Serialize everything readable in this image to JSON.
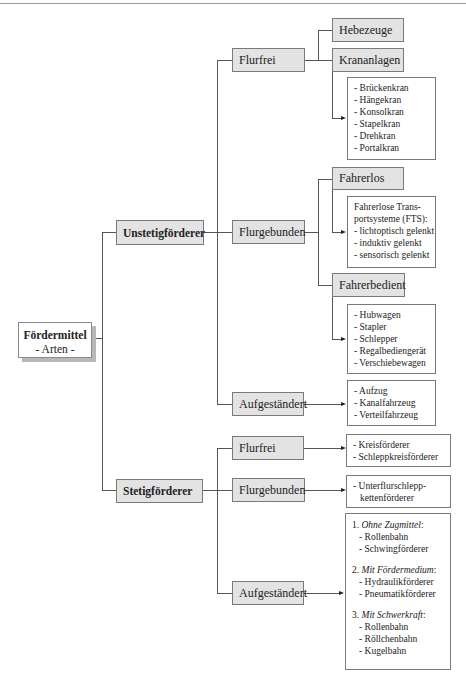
{
  "root": {
    "title": "Fördermittel",
    "subtitle": "- Arten -"
  },
  "unstetig": {
    "label": "Unstetigförderer",
    "flurfrei": {
      "label": "Flurfrei",
      "hebezeuge": "Hebezeuge",
      "krananlagen": "Krananlagen",
      "kran_list": [
        "- Brückenkran",
        "- Hängekran",
        "- Konsolkran",
        "- Stapelkran",
        "- Drehkran",
        "- Portalkran"
      ]
    },
    "flurgebunden": {
      "label": "Flurgebunden",
      "fahrerlos": "Fahrerlos",
      "fts_list": [
        "Fahrerlose Trans-",
        "portsysteme (FTS):",
        "- lichtoptisch gelenkt",
        "- induktiv gelenkt",
        "- sensorisch gelenkt"
      ],
      "fahrerbedient": "Fahrerbedient",
      "fahrerbedient_list": [
        "- Hubwagen",
        "- Stapler",
        "- Schlepper",
        "- Regalbediengerät",
        "- Verschiebewagen"
      ]
    },
    "aufgestaendert": {
      "label": "Aufgeständert",
      "list": [
        "- Aufzug",
        "- Kanalfahrzeug",
        "- Verteilfahrzeug"
      ]
    }
  },
  "stetig": {
    "label": "Stetigförderer",
    "flurfrei": {
      "label": "Flurfrei",
      "list": [
        "- Kreisförderer",
        "- Schleppkreisförderer"
      ]
    },
    "flurgebunden": {
      "label": "Flurgebunden",
      "list": [
        "- Unterflurschlepp-",
        "kettenförderer"
      ]
    },
    "aufgestaendert": {
      "label": "Aufgeständert",
      "groups": [
        {
          "num": "1.",
          "title": "Ohne Zugmittel",
          "items": [
            "- Rollenbahn",
            "- Schwingförderer"
          ]
        },
        {
          "num": "2.",
          "title": "Mit Fördermedium",
          "items": [
            "- Hydraulikförderer",
            "- Pneumatikförderer"
          ]
        },
        {
          "num": "3.",
          "title": "Mit Schwerkraft",
          "items": [
            "- Rollenbahn",
            "- Röllchenbahn",
            "- Kugelbahn"
          ]
        }
      ]
    }
  },
  "colors": {
    "box_fill": "#e3e3e3",
    "border": "#7a7a7a",
    "line": "#555555"
  }
}
